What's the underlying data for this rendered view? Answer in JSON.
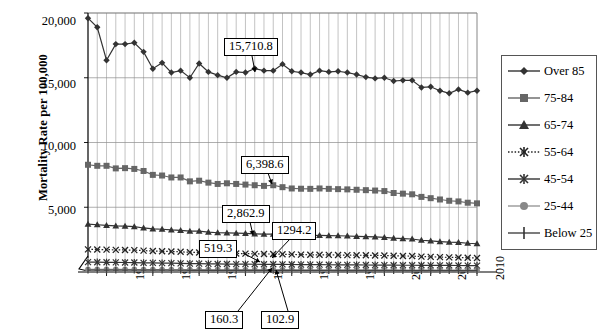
{
  "chart_data": {
    "type": "line",
    "title": "",
    "xlabel": "",
    "ylabel": "Mortality Rate per 100,000",
    "ylim": [
      0,
      20000
    ],
    "xlim": [
      1968,
      2010
    ],
    "grid": true,
    "y_ticks": [
      "20,000",
      "15,000",
      "10,000",
      "5,000"
    ],
    "y_tick_values": [
      20000,
      15000,
      10000,
      5000
    ],
    "x_ticks": [
      "1970",
      "1975",
      "1980",
      "1985",
      "1990",
      "1995",
      "2000",
      "2005",
      "2010"
    ],
    "x_tick_values": [
      1970,
      1975,
      1980,
      1985,
      1990,
      1995,
      2000,
      2005,
      2010
    ],
    "axis_break": "y-axis-break-zigzag",
    "legend_position": "right",
    "x": [
      1968,
      1969,
      1970,
      1971,
      1972,
      1973,
      1974,
      1975,
      1976,
      1977,
      1978,
      1979,
      1980,
      1981,
      1982,
      1983,
      1984,
      1985,
      1986,
      1987,
      1988,
      1989,
      1990,
      1991,
      1992,
      1993,
      1994,
      1995,
      1996,
      1997,
      1998,
      1999,
      2000,
      2001,
      2002,
      2003,
      2004,
      2005,
      2006,
      2007,
      2008,
      2009,
      2010
    ],
    "series": [
      {
        "name": "Over 85",
        "marker": "diamond",
        "color": "#333333",
        "linestyle": "solid",
        "values": [
          19600,
          18900,
          16350,
          17600,
          17600,
          17700,
          17000,
          15700,
          16150,
          15400,
          15550,
          15000,
          16100,
          15450,
          15200,
          15000,
          15450,
          15400,
          15710.8,
          15550,
          15550,
          16050,
          15500,
          15400,
          15250,
          15550,
          15450,
          15500,
          15400,
          15250,
          15050,
          14950,
          15000,
          14750,
          14800,
          14800,
          14250,
          14300,
          14000,
          13800,
          14100,
          13850,
          14000
        ]
      },
      {
        "name": "75-84",
        "marker": "square",
        "color": "#666666",
        "linestyle": "solid",
        "values": [
          8280,
          8200,
          8200,
          8000,
          8020,
          7960,
          7800,
          7500,
          7450,
          7300,
          7300,
          7000,
          7050,
          6900,
          6800,
          6850,
          6800,
          6750,
          6700,
          6650,
          6700,
          6550,
          6450,
          6430,
          6420,
          6450,
          6420,
          6398.6,
          6380,
          6350,
          6320,
          6290,
          6250,
          6100,
          6050,
          6000,
          5800,
          5700,
          5600,
          5500,
          5450,
          5350,
          5300
        ]
      },
      {
        "name": "65-74",
        "marker": "triangle",
        "color": "#333333",
        "linestyle": "solid",
        "values": [
          3700,
          3650,
          3600,
          3560,
          3540,
          3500,
          3400,
          3330,
          3300,
          3250,
          3220,
          3150,
          3150,
          3080,
          3030,
          3020,
          3000,
          2980,
          2950,
          2920,
          2930,
          2890,
          2862.9,
          2840,
          2820,
          2830,
          2810,
          2800,
          2780,
          2750,
          2730,
          2710,
          2680,
          2620,
          2580,
          2550,
          2450,
          2400,
          2350,
          2300,
          2280,
          2220,
          2180
        ]
      },
      {
        "name": "55-64",
        "marker": "x",
        "color": "#222222",
        "linestyle": "dotted",
        "values": [
          1750,
          1740,
          1730,
          1710,
          1700,
          1690,
          1650,
          1620,
          1600,
          1580,
          1560,
          1520,
          1510,
          1480,
          1450,
          1440,
          1430,
          1420,
          1400,
          1390,
          1390,
          1370,
          1360,
          1340,
          1330,
          1330,
          1320,
          1310,
          1300,
          1294.2,
          1290,
          1280,
          1270,
          1250,
          1240,
          1230,
          1190,
          1170,
          1150,
          1130,
          1120,
          1100,
          1080
        ]
      },
      {
        "name": "45-54",
        "marker": "asterisk",
        "color": "#333333",
        "linestyle": "solid",
        "values": [
          760,
          755,
          750,
          740,
          735,
          730,
          710,
          700,
          690,
          680,
          670,
          650,
          645,
          630,
          620,
          615,
          610,
          605,
          600,
          595,
          595,
          585,
          580,
          570,
          565,
          565,
          560,
          555,
          550,
          545,
          540,
          535,
          530,
          525,
          523,
          521,
          519.3,
          515,
          510,
          505,
          500,
          495,
          490
        ]
      },
      {
        "name": "25-44",
        "marker": "circle",
        "color": "#888888",
        "linestyle": "solid",
        "values": [
          200,
          199,
          198,
          196,
          195,
          194,
          190,
          188,
          186,
          184,
          182,
          178,
          176,
          174,
          172,
          170,
          169,
          168,
          167,
          166,
          166,
          165,
          164,
          163,
          163,
          162,
          162,
          161,
          161,
          160.3,
          160,
          159,
          158,
          157,
          156,
          155,
          152,
          150,
          148,
          146,
          145,
          143,
          142
        ]
      },
      {
        "name": "Below 25",
        "marker": "plus",
        "color": "#444444",
        "linestyle": "solid",
        "values": [
          150,
          149,
          148,
          147,
          146,
          145,
          143,
          141,
          139,
          137,
          135,
          132,
          130,
          128,
          126,
          124,
          123,
          122,
          121,
          120,
          120,
          119,
          118,
          117,
          116,
          115,
          114,
          113,
          112,
          111,
          110,
          109,
          108,
          107,
          106,
          105,
          104,
          103,
          102.9,
          102,
          101,
          100,
          99
        ]
      }
    ],
    "annotations": [
      {
        "label": "15,710.8",
        "series": "Over 85",
        "year": 1986,
        "value": 15710.8
      },
      {
        "label": "6,398.6",
        "series": "75-84",
        "year": 1995,
        "value": 6398.6
      },
      {
        "label": "2,862.9",
        "series": "65-74",
        "year": 1990,
        "value": 2862.9
      },
      {
        "label": "1294.2",
        "series": "55-64",
        "year": 1997,
        "value": 1294.2
      },
      {
        "label": "519.3",
        "series": "45-54",
        "year": 2004,
        "value": 519.3
      },
      {
        "label": "160.3",
        "series": "25-44",
        "year": 1997,
        "value": 160.3
      },
      {
        "label": "102.9",
        "series": "Below 25",
        "year": 2006,
        "value": 102.9
      }
    ]
  },
  "legend": {
    "items": [
      {
        "label": "Over 85"
      },
      {
        "label": "75-84"
      },
      {
        "label": "65-74"
      },
      {
        "label": "55-64"
      },
      {
        "label": "45-54"
      },
      {
        "label": "25-44"
      },
      {
        "label": "Below 25"
      }
    ]
  }
}
